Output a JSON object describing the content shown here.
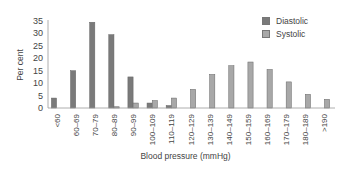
{
  "chart_data": {
    "type": "bar",
    "title": "",
    "xlabel": "Blood pressure (mmHg)",
    "ylabel": "Per cent",
    "ylim": [
      0,
      35
    ],
    "yticks": [
      0,
      5,
      10,
      15,
      20,
      25,
      30,
      35
    ],
    "grid": false,
    "legend_position": "top-right",
    "categories": [
      "<60",
      "60–69",
      "70–79",
      "80–89",
      "90–99",
      "100–109",
      "110–119",
      "120–129",
      "130–139",
      "140–149",
      "150–159",
      "160–169",
      "170–179",
      "180–189",
      ">190"
    ],
    "series": [
      {
        "name": "Diastolic",
        "color": "#7a7a7a",
        "values": [
          4,
          15,
          34.5,
          29.5,
          12.5,
          2,
          1,
          0,
          0,
          0,
          0,
          0,
          0,
          0,
          0
        ]
      },
      {
        "name": "Systolic",
        "color": "#a8a8a8",
        "values": [
          0,
          0,
          0,
          0.5,
          2,
          3,
          4,
          7.5,
          13.5,
          17,
          18.5,
          15.5,
          10.5,
          5.5,
          3.5
        ]
      }
    ]
  },
  "legend": {
    "items": [
      {
        "label": "Diastolic",
        "color": "#7a7a7a"
      },
      {
        "label": "Systolic",
        "color": "#a8a8a8"
      }
    ]
  },
  "axes": {
    "xlabel": "Blood pressure (mmHg)",
    "ylabel": "Per cent"
  }
}
